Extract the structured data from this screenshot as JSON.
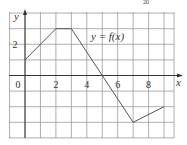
{
  "header_fragment": "20",
  "chart_data": {
    "type": "line",
    "title": "",
    "function_label": "y = f(x)",
    "xlabel": "x",
    "ylabel": "y",
    "x": [
      0,
      2,
      3,
      7,
      9
    ],
    "y": [
      1,
      3,
      3,
      -3,
      -2
    ],
    "x_ticks": [
      "0",
      "2",
      "4",
      "6",
      "8"
    ],
    "y_ticks": [
      "2"
    ],
    "xlim": [
      -1,
      9.6
    ],
    "ylim": [
      -4,
      4
    ],
    "grid": true,
    "grid_step": 1,
    "legend": null
  },
  "colors": {
    "grid": "#9a9a9a",
    "axis": "#333333",
    "curve": "#555555",
    "text": "#333333"
  }
}
